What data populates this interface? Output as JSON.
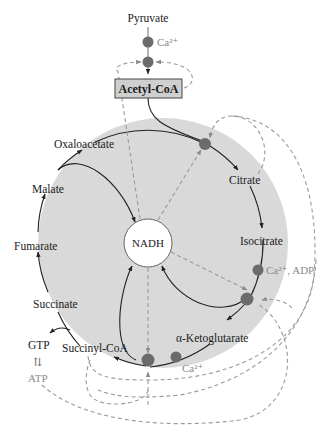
{
  "diagram": {
    "inputs": {
      "pyruvate": "Pyruvate",
      "acetyl_coa": "Acetyl-CoA"
    },
    "center": "NADH",
    "intermediates": [
      "Citrate",
      "Isocitrate",
      "α-Ketoglutarate",
      "Succinyl-CoA",
      "Succinate",
      "Fumarate",
      "Malate",
      "Oxaloacetate"
    ],
    "side_products": {
      "gtp": "GTP",
      "atp": "ATP",
      "exchange_symbol": "⇅"
    },
    "regulators": {
      "pdh_activator": "Ca²⁺",
      "idh_activators": "Ca²⁺, ADP",
      "akgdh_activator": "Ca²⁺"
    },
    "colors": {
      "cycle_fill": "#d9d9d9",
      "enzyme_dot": "#6b6b6b",
      "inhibition_dash": "#9a9a9a",
      "box_fill": "#cfcfcf",
      "activator_text": "#8a8a8a"
    }
  }
}
